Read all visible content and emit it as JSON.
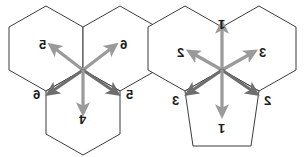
{
  "figure": {
    "background_color": "#ffffff",
    "outline_color": "#3d3d3d",
    "arrow_color_light": "#9a9a9a",
    "arrow_color_dark": "#6e6e6e",
    "label_color": "#1c1c1c"
  },
  "left_cluster": {
    "name": "left-hexagon-cluster",
    "cell_count": 3,
    "cells": [
      {
        "id": "left-cell-top-left",
        "shape": "hexagon"
      },
      {
        "id": "left-cell-top-right",
        "shape": "hexagon"
      },
      {
        "id": "left-cell-bottom",
        "shape": "hexagon"
      }
    ],
    "arrow_count": 5,
    "labels": [
      {
        "id": "left-label-upper-left",
        "text": "5",
        "orientation": "mirrored-horizontal"
      },
      {
        "id": "left-label-upper-right",
        "text": "6",
        "orientation": "mirrored-horizontal"
      },
      {
        "id": "left-label-lower-left",
        "text": "6",
        "orientation": "mirrored-horizontal"
      },
      {
        "id": "left-label-lower-right",
        "text": "5",
        "orientation": "mirrored-horizontal"
      },
      {
        "id": "left-label-bottom",
        "text": "4",
        "orientation": "mirrored-both"
      }
    ],
    "arrows": [
      {
        "id": "left-arrow-upper-left",
        "direction": "upper-left",
        "tone": "light"
      },
      {
        "id": "left-arrow-upper-right",
        "direction": "upper-right",
        "tone": "light"
      },
      {
        "id": "left-arrow-lower-left",
        "direction": "lower-left",
        "tone": "dark"
      },
      {
        "id": "left-arrow-lower-right",
        "direction": "lower-right",
        "tone": "dark"
      },
      {
        "id": "left-arrow-down",
        "direction": "down",
        "tone": "light"
      }
    ]
  },
  "right_cluster": {
    "name": "right-hexagon-cluster",
    "cell_count": 3,
    "cells": [
      {
        "id": "right-cell-top-left",
        "shape": "hexagon"
      },
      {
        "id": "right-cell-top-right",
        "shape": "hexagon"
      },
      {
        "id": "right-cell-bottom",
        "shape": "pentagon"
      }
    ],
    "arrow_count": 6,
    "labels": [
      {
        "id": "right-label-top",
        "text": "1",
        "orientation": "mirrored-both"
      },
      {
        "id": "right-label-upper-left",
        "text": "2",
        "orientation": "mirrored-horizontal"
      },
      {
        "id": "right-label-upper-right",
        "text": "3",
        "orientation": "mirrored-horizontal"
      },
      {
        "id": "right-label-lower-left",
        "text": "3",
        "orientation": "mirrored-horizontal"
      },
      {
        "id": "right-label-lower-right",
        "text": "2",
        "orientation": "mirrored-horizontal"
      },
      {
        "id": "right-label-bottom",
        "text": "1",
        "orientation": "mirrored-both"
      }
    ],
    "arrows": [
      {
        "id": "right-arrow-up",
        "direction": "up",
        "tone": "light"
      },
      {
        "id": "right-arrow-upper-left",
        "direction": "upper-left",
        "tone": "light"
      },
      {
        "id": "right-arrow-upper-right",
        "direction": "upper-right",
        "tone": "light"
      },
      {
        "id": "right-arrow-lower-left",
        "direction": "lower-left",
        "tone": "dark"
      },
      {
        "id": "right-arrow-lower-right",
        "direction": "lower-right",
        "tone": "dark"
      },
      {
        "id": "right-arrow-down",
        "direction": "down",
        "tone": "light"
      }
    ]
  }
}
